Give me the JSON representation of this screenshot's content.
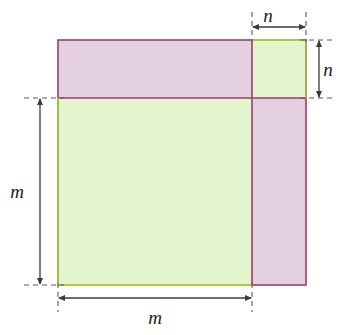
{
  "figure": {
    "background_color": "#ffffff",
    "colors": {
      "green_fill": "#e2f5cd",
      "green_stroke": "#a9c93f",
      "purple_fill": "#e4cfe1",
      "purple_stroke": "#9c3d6e",
      "dimension_line": "#3a3a3a",
      "dashed_guide": "#5a5a5a"
    },
    "shapes": [
      {
        "name": "purple-square",
        "fill": "#e4cfe1",
        "stroke": "#9c3d6e",
        "x": 58,
        "y": 40,
        "width": 248,
        "height": 245,
        "side_label": "m"
      },
      {
        "name": "green-square",
        "fill": "#e2f5cd",
        "stroke": "#a9c93f",
        "x": 58,
        "y": 40,
        "width": 248,
        "height": 245,
        "side_label": "m"
      }
    ],
    "offset": {
      "label": "n",
      "horizontal": 54,
      "vertical": 58
    },
    "dimensions": [
      {
        "name": "n-top",
        "label": "n",
        "orientation": "horizontal",
        "from": 252,
        "to": 306,
        "at": 26
      },
      {
        "name": "n-right",
        "label": "n",
        "orientation": "vertical",
        "from": 40,
        "to": 98,
        "at": 318
      },
      {
        "name": "m-left",
        "label": "m",
        "orientation": "vertical",
        "from": 98,
        "to": 285,
        "at": 40
      },
      {
        "name": "m-bottom",
        "label": "m",
        "orientation": "horizontal",
        "from": 58,
        "to": 252,
        "at": 298
      }
    ],
    "labels": {
      "n_top": "n",
      "n_right": "n",
      "m_left": "m",
      "m_bottom": "m"
    }
  }
}
